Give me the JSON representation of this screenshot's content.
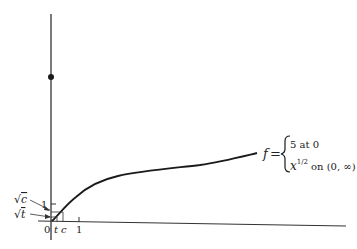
{
  "figure": {
    "function_name": "f",
    "equals": "=",
    "cases": [
      {
        "expr": "5 at 0"
      },
      {
        "base": "x",
        "exponent": "1/2",
        "suffix": "on (0, ∞)"
      }
    ],
    "x_axis": {
      "origin_label": "0",
      "tick_labels": [
        "t",
        "c",
        "1"
      ]
    },
    "y_axis": {
      "tick_labels": [
        "1"
      ],
      "annotations": [
        {
          "radical": "√",
          "var": "c"
        },
        {
          "radical": "√",
          "var": "t"
        }
      ]
    },
    "isolated_point": {
      "x": 0,
      "y": 5
    }
  },
  "colors": {
    "ink": "#1a1a1a",
    "axis": "#333333",
    "background": "#ffffff"
  }
}
